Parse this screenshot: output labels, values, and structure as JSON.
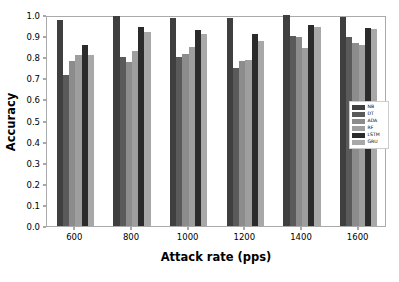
{
  "chart_data": {
    "type": "bar",
    "title": "",
    "xlabel": "Attack rate (pps)",
    "ylabel": "Accuracy",
    "categories": [
      "600",
      "800",
      "1000",
      "1200",
      "1400",
      "1600"
    ],
    "ylim": [
      0.0,
      1.0
    ],
    "yticks": [
      "0.0",
      "0.1",
      "0.2",
      "0.3",
      "0.4",
      "0.5",
      "0.6",
      "0.7",
      "0.8",
      "0.9",
      "1.0"
    ],
    "grid": false,
    "legend_position": "center right",
    "series": [
      {
        "name": "NB",
        "color": "#3f3f3f",
        "values": [
          0.978,
          0.996,
          0.985,
          0.985,
          0.998,
          0.989
        ]
      },
      {
        "name": "DT",
        "color": "#5a5a5a",
        "values": [
          0.715,
          0.801,
          0.799,
          0.751,
          0.902,
          0.896
        ]
      },
      {
        "name": "ADA",
        "color": "#8c8c8c",
        "values": [
          0.78,
          0.777,
          0.815,
          0.784,
          0.895,
          0.866
        ]
      },
      {
        "name": "RF",
        "color": "#9e9e9e",
        "values": [
          0.81,
          0.831,
          0.85,
          0.786,
          0.845,
          0.857
        ]
      },
      {
        "name": "LSTM",
        "color": "#2b2b2b",
        "values": [
          0.859,
          0.943,
          0.928,
          0.91,
          0.952,
          0.938
        ]
      },
      {
        "name": "GRU",
        "color": "#a8a8a8",
        "values": [
          0.811,
          0.92,
          0.908,
          0.879,
          0.941,
          0.935
        ]
      }
    ]
  }
}
